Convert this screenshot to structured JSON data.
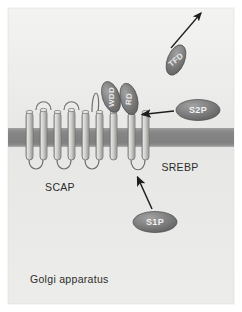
{
  "figure": {
    "panel_label": "Golgi apparatus",
    "background_color": "#ffffff",
    "panel_color": "#e9e9e7",
    "membrane_color": "#8b8b8b",
    "oval_color": "#7d7d7d",
    "helix_color": "#c9c9c7",
    "stroke_color": "#3a3a3a"
  },
  "labels": {
    "scap": "SCAP",
    "srebp": "SREBP",
    "golgi": "Golgi apparatus"
  },
  "ovals": [
    {
      "id": "wdd",
      "label": "WDD",
      "cx": 111,
      "cy": 97,
      "rx": 8.5,
      "ry": 16,
      "rotate": -18,
      "text_rotate": -72
    },
    {
      "id": "rd",
      "label": "RD",
      "cx": 129,
      "cy": 99,
      "rx": 8.5,
      "ry": 16,
      "rotate": -14,
      "text_rotate": -72
    },
    {
      "id": "tfd",
      "label": "TFD",
      "cx": 176,
      "cy": 60,
      "rx": 8.5,
      "ry": 16,
      "rotate": 22,
      "text_rotate": -62
    },
    {
      "id": "s2p",
      "label": "S2P",
      "cx": 198,
      "cy": 110,
      "rx": 22,
      "ry": 10.5,
      "rotate": 0,
      "text_rotate": 0
    },
    {
      "id": "s1p",
      "label": "S1P",
      "cx": 155,
      "cy": 222,
      "rx": 22,
      "ry": 10.5,
      "rotate": 0,
      "text_rotate": 0
    }
  ],
  "arrows": [
    {
      "id": "s2p-cleavage-arrow",
      "from": [
        174,
        111
      ],
      "to": [
        141,
        114
      ],
      "label": "S2P cleavage site"
    },
    {
      "id": "s1p-cleavage-arrow",
      "from": [
        152,
        209
      ],
      "to": [
        136,
        176
      ],
      "label": "S1P cleavage site"
    },
    {
      "id": "tfd-release-arrow",
      "from": [
        170,
        47
      ],
      "to": [
        202,
        12
      ],
      "label": "TFD release to nucleus"
    }
  ],
  "membrane": {
    "y_top": 128,
    "y_bottom": 147
  },
  "scap_helix_count": 7,
  "srebp_helix_count": 2,
  "geometry": {
    "panel": {
      "x": 8,
      "y": 8,
      "w": 226,
      "h": 296
    }
  }
}
